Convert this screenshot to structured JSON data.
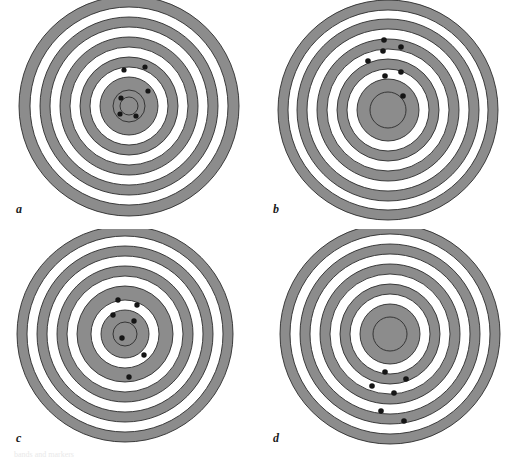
{
  "figure": {
    "background_color": "#ffffff",
    "width": 514,
    "height": 459,
    "ring_fill_gray": "#8c8c8c",
    "ring_fill_white": "#ffffff",
    "ring_stroke_color": "#2b2b2b",
    "ring_stroke_width": 0.9,
    "marker_color": "#151515",
    "caption_partial": "bands and markers"
  },
  "panels": [
    {
      "id": "a",
      "label": "a",
      "center": {
        "x": 129,
        "y": 106
      },
      "rings": [
        {
          "r": 110,
          "fill": "#8c8c8c"
        },
        {
          "r": 99,
          "fill": "#ffffff"
        },
        {
          "r": 89,
          "fill": "#8c8c8c"
        },
        {
          "r": 79,
          "fill": "#ffffff"
        },
        {
          "r": 69,
          "fill": "#8c8c8c"
        },
        {
          "r": 59,
          "fill": "#ffffff"
        },
        {
          "r": 49,
          "fill": "#8c8c8c"
        },
        {
          "r": 39,
          "fill": "#ffffff"
        },
        {
          "r": 29,
          "fill": "#8c8c8c"
        },
        {
          "r": 16,
          "fill": "#8c8c8c"
        },
        {
          "r": 9,
          "fill": "#8c8c8c"
        }
      ],
      "markers": [
        {
          "x": 124,
          "y": 70,
          "r": 2.6
        },
        {
          "x": 145,
          "y": 67,
          "r": 2.6
        },
        {
          "x": 148,
          "y": 91,
          "r": 2.6
        },
        {
          "x": 121,
          "y": 98,
          "r": 2.6
        },
        {
          "x": 120,
          "y": 114,
          "r": 2.6
        },
        {
          "x": 136,
          "y": 116,
          "r": 2.6
        }
      ]
    },
    {
      "id": "b",
      "label": "b",
      "center": {
        "x": 131,
        "y": 110
      },
      "rings": [
        {
          "r": 110,
          "fill": "#8c8c8c"
        },
        {
          "r": 100,
          "fill": "#ffffff"
        },
        {
          "r": 91,
          "fill": "#8c8c8c"
        },
        {
          "r": 81,
          "fill": "#ffffff"
        },
        {
          "r": 71,
          "fill": "#8c8c8c"
        },
        {
          "r": 61,
          "fill": "#ffffff"
        },
        {
          "r": 51,
          "fill": "#8c8c8c"
        },
        {
          "r": 41,
          "fill": "#ffffff"
        },
        {
          "r": 31,
          "fill": "#8c8c8c"
        },
        {
          "r": 18,
          "fill": "#8c8c8c"
        }
      ],
      "markers": [
        {
          "x": 127,
          "y": 40,
          "r": 2.8
        },
        {
          "x": 144,
          "y": 47,
          "r": 2.8
        },
        {
          "x": 126,
          "y": 51,
          "r": 2.8
        },
        {
          "x": 111,
          "y": 61,
          "r": 2.8
        },
        {
          "x": 128,
          "y": 76,
          "r": 2.8
        },
        {
          "x": 144,
          "y": 72,
          "r": 2.8
        },
        {
          "x": 146,
          "y": 96,
          "r": 2.8
        }
      ]
    },
    {
      "id": "c",
      "label": "c",
      "center": {
        "x": 125,
        "y": 105
      },
      "rings": [
        {
          "r": 108,
          "fill": "#8c8c8c"
        },
        {
          "r": 98,
          "fill": "#ffffff"
        },
        {
          "r": 88,
          "fill": "#8c8c8c"
        },
        {
          "r": 78,
          "fill": "#ffffff"
        },
        {
          "r": 68,
          "fill": "#8c8c8c"
        },
        {
          "r": 58,
          "fill": "#ffffff"
        },
        {
          "r": 48,
          "fill": "#8c8c8c"
        },
        {
          "r": 34,
          "fill": "#ffffff"
        },
        {
          "r": 24,
          "fill": "#8c8c8c"
        },
        {
          "r": 12,
          "fill": "#8c8c8c"
        }
      ],
      "markers": [
        {
          "x": 118,
          "y": 71,
          "r": 2.7
        },
        {
          "x": 137,
          "y": 76,
          "r": 2.7
        },
        {
          "x": 113,
          "y": 86,
          "r": 2.7
        },
        {
          "x": 134,
          "y": 92,
          "r": 2.7
        },
        {
          "x": 122,
          "y": 109,
          "r": 2.7
        },
        {
          "x": 144,
          "y": 126,
          "r": 2.7
        },
        {
          "x": 129,
          "y": 148,
          "r": 2.7
        }
      ]
    },
    {
      "id": "d",
      "label": "d",
      "center": {
        "x": 133,
        "y": 105
      },
      "rings": [
        {
          "r": 110,
          "fill": "#8c8c8c"
        },
        {
          "r": 100,
          "fill": "#ffffff"
        },
        {
          "r": 90,
          "fill": "#8c8c8c"
        },
        {
          "r": 80,
          "fill": "#ffffff"
        },
        {
          "r": 70,
          "fill": "#8c8c8c"
        },
        {
          "r": 60,
          "fill": "#ffffff"
        },
        {
          "r": 50,
          "fill": "#8c8c8c"
        },
        {
          "r": 40,
          "fill": "#ffffff"
        },
        {
          "r": 30,
          "fill": "#8c8c8c"
        },
        {
          "r": 17,
          "fill": "#8c8c8c"
        }
      ],
      "markers": [
        {
          "x": 128,
          "y": 143,
          "r": 2.8
        },
        {
          "x": 149,
          "y": 150,
          "r": 2.8
        },
        {
          "x": 115,
          "y": 157,
          "r": 2.8
        },
        {
          "x": 137,
          "y": 164,
          "r": 2.8
        },
        {
          "x": 124,
          "y": 182,
          "r": 2.8
        },
        {
          "x": 147,
          "y": 192,
          "r": 2.8
        }
      ]
    }
  ]
}
